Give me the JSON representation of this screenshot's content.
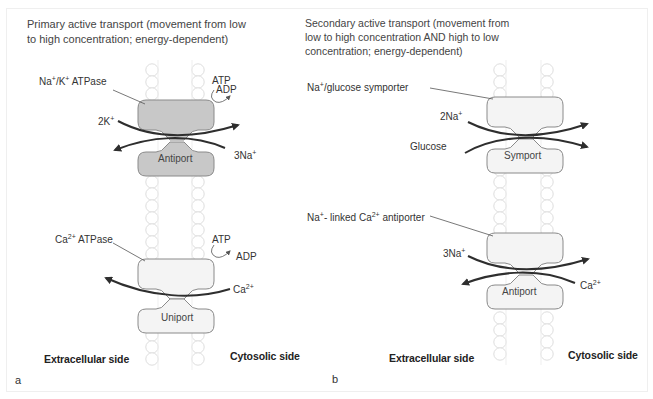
{
  "figure": {
    "panels": [
      {
        "id": "a",
        "letter": "a",
        "title_line1": "Primary active transport (movement from low",
        "title_line2": "to high concentration; energy-dependent)",
        "side_left": "Extracellular side",
        "side_right": "Cytosolic side",
        "transporters": [
          {
            "name_main": "Na",
            "name_sup1": "+",
            "name_mid": "/K",
            "name_sup2": "+",
            "name_tail": " ATPase",
            "type_label": "Antiport",
            "fill": "#c8c8c8",
            "energy_in": "ATP",
            "energy_out": "ADP",
            "ion_left_coef": "2K",
            "ion_left_sup": "+",
            "ion_right_coef": "3Na",
            "ion_right_sup": "+"
          },
          {
            "name_main": "Ca",
            "name_sup1": "2+",
            "name_tail": " ATPase",
            "type_label": "Uniport",
            "fill": "#f4f4f4",
            "energy_in": "ATP",
            "energy_out": "ADP",
            "ion_right_coef": "Ca",
            "ion_right_sup": "2+"
          }
        ]
      },
      {
        "id": "b",
        "letter": "b",
        "title_line1": "Secondary active transport (movement from",
        "title_line2": "low to high concentration AND high to low",
        "title_line3": "concentration; energy-dependent)",
        "side_left": "Extracellular side",
        "side_right": "Cytosolic side",
        "transporters": [
          {
            "name_main": "Na",
            "name_sup1": "+",
            "name_tail": "/glucose symporter",
            "type_label": "Symport",
            "fill": "#f4f4f4",
            "ion_left_coef": "2Na",
            "ion_left_sup": "+",
            "ion_left2": "Glucose"
          },
          {
            "name_main": "Na",
            "name_sup1": "+",
            "name_mid": "- linked Ca",
            "name_sup2": "2+",
            "name_tail": " antiporter",
            "type_label": "Antiport",
            "fill": "#f4f4f4",
            "ion_left_coef": "3Na",
            "ion_left_sup": "+",
            "ion_right_coef": "Ca",
            "ion_right_sup": "2+"
          }
        ]
      }
    ]
  },
  "colors": {
    "protein_dark": "#c8c8c8",
    "protein_light": "#f4f4f4",
    "outline": "#8a8a8a",
    "membrane": "#dcdcdc",
    "arrow": "#333333"
  }
}
